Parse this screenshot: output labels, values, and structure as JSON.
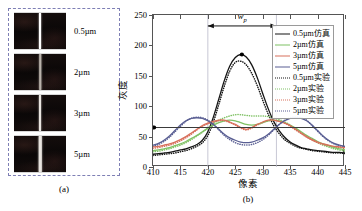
{
  "figure": {
    "panel_a": {
      "caption": "(a)",
      "strips": [
        {
          "label": "0.5µm",
          "line_brightness": "bright",
          "line_width_px": 2.0
        },
        {
          "label": "2µm",
          "line_brightness": "dim",
          "line_width_px": 1.5
        },
        {
          "label": "3µm",
          "line_brightness": "medium",
          "line_width_px": 2.0
        },
        {
          "label": "5µm",
          "line_brightness": "medium",
          "line_width_px": 2.5
        }
      ]
    },
    "panel_b": {
      "caption": "(b)"
    }
  },
  "chart_data": {
    "type": "line",
    "title": "",
    "xlabel": "像素",
    "ylabel": "灰度",
    "xlim": [
      410,
      445
    ],
    "ylim": [
      0,
      250
    ],
    "xticks": [
      410,
      415,
      420,
      425,
      430,
      435,
      440,
      445
    ],
    "yticks": [
      0,
      50,
      100,
      150,
      200,
      250
    ],
    "grid": false,
    "legend_position": "top-right",
    "annotations": [
      {
        "name": "wp-span",
        "label": "w",
        "sublabel": "p",
        "x_start": 420.0,
        "x_end": 432.5,
        "y": 232
      },
      {
        "name": "threshold-line",
        "type": "hline",
        "y": 65,
        "color": "#3a3a3a"
      },
      {
        "name": "threshold-marker",
        "type": "point",
        "x": 410.2,
        "y": 65,
        "color": "#000000"
      },
      {
        "name": "peak-marker",
        "type": "point",
        "x": 426.2,
        "y": 185,
        "color": "#000000"
      }
    ],
    "vlines": [
      {
        "x": 420.0,
        "color": "#b9b9c9"
      },
      {
        "x": 432.5,
        "color": "#b9b9c9"
      }
    ],
    "colors": {
      "0.5um": "#141414",
      "2um": "#7fc164",
      "3um": "#d8705c",
      "5um": "#5a5f93"
    },
    "x": [
      410,
      411,
      412,
      413,
      414,
      415,
      416,
      417,
      418,
      419,
      420,
      421,
      422,
      423,
      424,
      425,
      426,
      427,
      428,
      429,
      430,
      431,
      432,
      433,
      434,
      435,
      436,
      437,
      438,
      439,
      440,
      441,
      442,
      443,
      444,
      445
    ],
    "series": [
      {
        "name": "0.5µm仿真",
        "style": "solid",
        "color": "#141414",
        "values": [
          21,
          22,
          23,
          24,
          26,
          28,
          30,
          33,
          37,
          44,
          58,
          82,
          112,
          142,
          166,
          180,
          185,
          181,
          168,
          147,
          121,
          96,
          75,
          60,
          49,
          41,
          36,
          32,
          30,
          28,
          27,
          26,
          25,
          24,
          24,
          23
        ]
      },
      {
        "name": "2µm仿真",
        "style": "solid",
        "color": "#7fc164",
        "values": [
          27,
          28,
          30,
          32,
          35,
          38,
          42,
          47,
          52,
          58,
          64,
          69,
          73,
          76,
          77,
          76,
          73,
          70,
          69,
          70,
          73,
          76,
          77,
          76,
          73,
          69,
          64,
          58,
          52,
          47,
          42,
          38,
          35,
          32,
          30,
          28
        ]
      },
      {
        "name": "3µm仿真",
        "style": "solid",
        "color": "#d8705c",
        "values": [
          33,
          34,
          36,
          38,
          41,
          45,
          50,
          56,
          62,
          68,
          72,
          75,
          77,
          77,
          74,
          70,
          65,
          62,
          65,
          70,
          74,
          77,
          77,
          75,
          72,
          68,
          62,
          56,
          50,
          45,
          41,
          38,
          36,
          34,
          33,
          32
        ]
      },
      {
        "name": "5µm仿真",
        "style": "solid",
        "color": "#5a5f93",
        "values": [
          36,
          39,
          44,
          51,
          60,
          69,
          76,
          80,
          81,
          80,
          76,
          70,
          62,
          54,
          48,
          44,
          41,
          40,
          41,
          44,
          48,
          54,
          62,
          70,
          76,
          80,
          81,
          80,
          76,
          69,
          60,
          51,
          44,
          39,
          36,
          34
        ]
      },
      {
        "name": "0.5µm实验",
        "style": "dotted",
        "color": "#141414",
        "values": [
          19,
          20,
          21,
          22,
          23,
          25,
          27,
          30,
          34,
          40,
          52,
          74,
          103,
          133,
          158,
          172,
          174,
          168,
          154,
          134,
          110,
          87,
          68,
          55,
          45,
          39,
          34,
          31,
          29,
          27,
          26,
          25,
          24,
          23,
          23,
          22
        ]
      },
      {
        "name": "2µm实验",
        "style": "dotted",
        "color": "#7fc164",
        "values": [
          25,
          26,
          28,
          30,
          33,
          36,
          40,
          45,
          51,
          57,
          64,
          71,
          77,
          81,
          84,
          86,
          86,
          85,
          84,
          84,
          84,
          83,
          81,
          78,
          74,
          69,
          62,
          56,
          50,
          45,
          40,
          36,
          33,
          30,
          28,
          26
        ]
      },
      {
        "name": "3µm实验",
        "style": "dotted",
        "color": "#d8705c",
        "values": [
          31,
          32,
          34,
          36,
          39,
          43,
          48,
          54,
          61,
          67,
          71,
          74,
          76,
          76,
          73,
          69,
          64,
          61,
          64,
          69,
          73,
          76,
          77,
          75,
          72,
          67,
          61,
          55,
          49,
          44,
          40,
          37,
          35,
          33,
          32,
          31
        ]
      },
      {
        "name": "5µm实验",
        "style": "dotted",
        "color": "#5a5f93",
        "values": [
          34,
          37,
          42,
          49,
          58,
          67,
          75,
          80,
          82,
          81,
          77,
          70,
          61,
          52,
          45,
          40,
          37,
          36,
          37,
          40,
          45,
          52,
          61,
          70,
          77,
          81,
          82,
          81,
          77,
          68,
          59,
          50,
          43,
          38,
          35,
          33
        ]
      }
    ]
  }
}
